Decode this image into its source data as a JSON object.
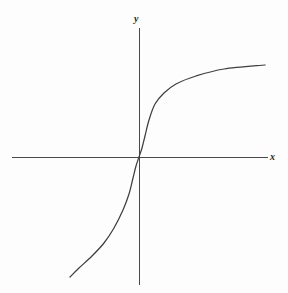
{
  "figure": {
    "background_color": "#fdfdfd",
    "line_color": "#3f3f3f",
    "axis_color": "#4a4a4a",
    "x_axis_label": "x",
    "y_axis_label": "y"
  },
  "chart_data": {
    "type": "line",
    "title": "",
    "subtitle": "",
    "xlabel": "x",
    "ylabel": "y",
    "grid": false,
    "legend": null,
    "axes": {
      "origin_px": [
        139,
        157
      ],
      "x_axis_span_px": [
        12,
        268
      ],
      "y_axis_span_px": [
        28,
        285
      ],
      "xlim": [
        -5,
        5
      ],
      "ylim": [
        -5,
        5
      ],
      "x_ticks": [],
      "y_ticks": [],
      "tick_labels_shown": false
    },
    "series": [
      {
        "name": "odd root curve",
        "description": "monotonically increasing odd function through the origin, steep near x=0 and flattening outward, resembling the cube root of x",
        "symmetry": "odd (rotationally symmetric about the origin)",
        "passes_through_origin": true,
        "x": [
          -3.4,
          -3.0,
          -2.5,
          -2.0,
          -1.5,
          -1.0,
          -0.6,
          -0.3,
          -0.1,
          0.0,
          0.1,
          0.3,
          0.6,
          1.0,
          1.5,
          2.0,
          2.5,
          3.0,
          3.4
        ],
        "y": [
          -3.15,
          -3.0,
          -2.82,
          -2.6,
          -2.35,
          -2.0,
          -1.7,
          -1.35,
          -0.93,
          0.0,
          0.93,
          1.35,
          1.7,
          2.0,
          2.35,
          2.6,
          2.82,
          3.0,
          3.15
        ],
        "points_px": [
          [
            70,
            277
          ],
          [
            79,
            268
          ],
          [
            92,
            256
          ],
          [
            104,
            243
          ],
          [
            114,
            228
          ],
          [
            123,
            210
          ],
          [
            129,
            194
          ],
          [
            133,
            178
          ],
          [
            136,
            166
          ],
          [
            139,
            157
          ],
          [
            142,
            148
          ],
          [
            145,
            136
          ],
          [
            149,
            120
          ],
          [
            155,
            104
          ],
          [
            164,
            93
          ],
          [
            176,
            84
          ],
          [
            196,
            76
          ],
          [
            224,
            69
          ],
          [
            265,
            65
          ]
        ]
      }
    ]
  }
}
